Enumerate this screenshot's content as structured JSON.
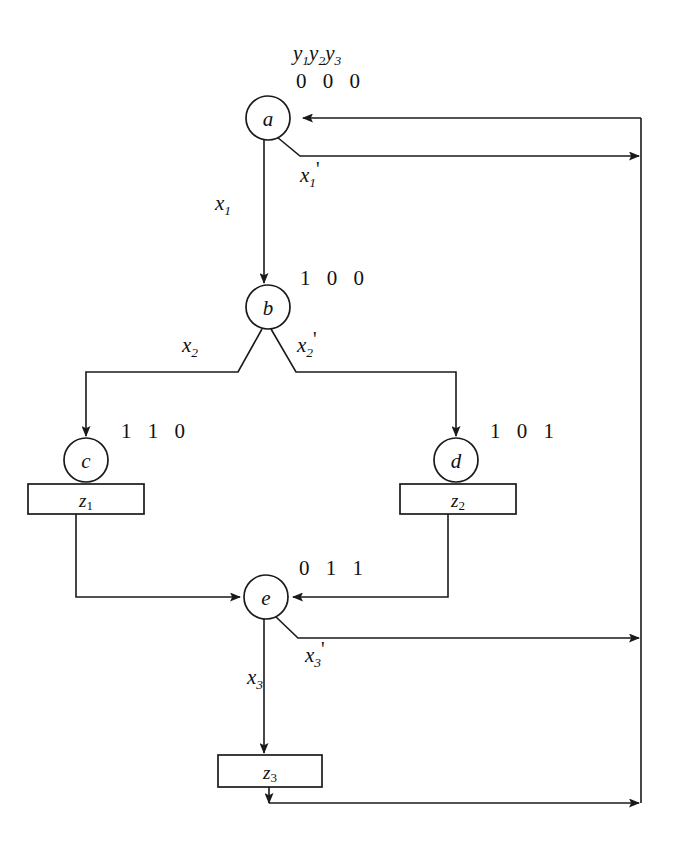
{
  "diagram": {
    "type": "state-flow-diagram",
    "title": "",
    "stroke_color": "#1a1a1a",
    "background_color": "#ffffff",
    "state_variable_header": {
      "vars": [
        "y",
        "y",
        "y"
      ],
      "subs": [
        "1",
        "2",
        "3"
      ],
      "text": "y1y2y3"
    },
    "states": [
      {
        "id": "a",
        "label": "a",
        "code": "0 0 0",
        "cx": 268,
        "cy": 118,
        "r": 22
      },
      {
        "id": "b",
        "label": "b",
        "code": "1 0 0",
        "cx": 268,
        "cy": 307,
        "r": 22
      },
      {
        "id": "c",
        "label": "c",
        "code": "1 1 0",
        "cx": 86,
        "cy": 460,
        "r": 22
      },
      {
        "id": "d",
        "label": "d",
        "code": "1 0 1",
        "cx": 456,
        "cy": 460,
        "r": 22
      },
      {
        "id": "e",
        "label": "e",
        "code": "0 1 1",
        "cx": 266,
        "cy": 597,
        "r": 22
      }
    ],
    "output_boxes": [
      {
        "id": "z1",
        "base": "z",
        "sub": "1",
        "label": "z1",
        "x": 28,
        "y": 484,
        "w": 116,
        "h": 30
      },
      {
        "id": "z2",
        "base": "z",
        "sub": "2",
        "label": "z2",
        "x": 400,
        "y": 484,
        "w": 116,
        "h": 30
      },
      {
        "id": "z3",
        "base": "z",
        "sub": "3",
        "label": "z3",
        "x": 218,
        "y": 755,
        "w": 104,
        "h": 32
      }
    ],
    "edge_labels": [
      {
        "id": "x1",
        "base": "x",
        "sub": "1",
        "prime": "",
        "x": 215,
        "y": 210
      },
      {
        "id": "x1prime",
        "base": "x",
        "sub": "1",
        "prime": "'",
        "x": 300,
        "y": 160
      },
      {
        "id": "x2",
        "base": "x",
        "sub": "2",
        "prime": "",
        "x": 185,
        "y": 352
      },
      {
        "id": "x2prime",
        "base": "x",
        "sub": "2",
        "prime": "'",
        "x": 297,
        "y": 352
      },
      {
        "id": "x3",
        "base": "x",
        "sub": "3",
        "prime": "",
        "x": 248,
        "y": 680
      },
      {
        "id": "x3prime",
        "base": "x",
        "sub": "3",
        "prime": "'",
        "x": 306,
        "y": 634
      }
    ],
    "bus": {
      "description": "right-hand feedback bus",
      "x": 641,
      "y_top": 118,
      "y_bottom": 803
    }
  }
}
